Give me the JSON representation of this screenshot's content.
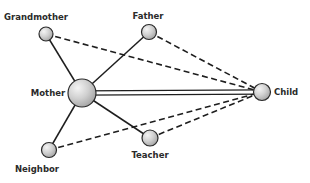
{
  "diagram": {
    "type": "network",
    "nodes": [
      {
        "id": "grandmother",
        "label": "Grandmother",
        "x": 46,
        "y": 34,
        "r": 7,
        "lx": 36,
        "ly": 20,
        "anchor": "middle"
      },
      {
        "id": "father",
        "label": "Father",
        "x": 149,
        "y": 32,
        "r": 7.5,
        "lx": 148,
        "ly": 19,
        "anchor": "middle"
      },
      {
        "id": "mother",
        "label": "Mother",
        "x": 82,
        "y": 93,
        "r": 14,
        "lx": 48,
        "ly": 96,
        "anchor": "middle"
      },
      {
        "id": "child",
        "label": "Child",
        "x": 262,
        "y": 92,
        "r": 8.5,
        "lx": 274,
        "ly": 95,
        "anchor": "start"
      },
      {
        "id": "teacher",
        "label": "Teacher",
        "x": 150,
        "y": 138,
        "r": 8,
        "lx": 150,
        "ly": 158,
        "anchor": "middle"
      },
      {
        "id": "neighbor",
        "label": "Neighbor",
        "x": 49,
        "y": 150,
        "r": 7.5,
        "lx": 37,
        "ly": 172,
        "anchor": "middle"
      }
    ],
    "edges": [
      {
        "from": "grandmother",
        "to": "mother",
        "style": "solid"
      },
      {
        "from": "father",
        "to": "mother",
        "style": "solid"
      },
      {
        "from": "mother",
        "to": "neighbor",
        "style": "solid"
      },
      {
        "from": "mother",
        "to": "teacher",
        "style": "solid"
      },
      {
        "from": "mother",
        "to": "child",
        "style": "double"
      },
      {
        "from": "grandmother",
        "to": "child",
        "style": "dashed"
      },
      {
        "from": "father",
        "to": "child",
        "style": "dashed"
      },
      {
        "from": "teacher",
        "to": "child",
        "style": "dashed"
      },
      {
        "from": "neighbor",
        "to": "child",
        "style": "dashed"
      }
    ],
    "colors": {
      "line": "#1e1e1e",
      "node_fill": "#c9c9c9",
      "node_highlight": "#f2f2f2",
      "node_stroke": "#2a2a2a",
      "label": "#2a2a2a"
    }
  }
}
